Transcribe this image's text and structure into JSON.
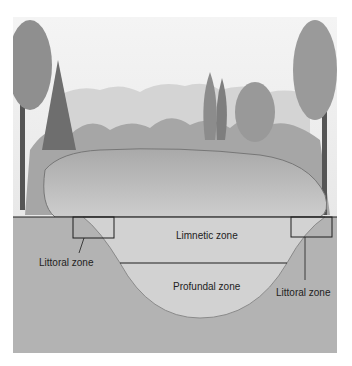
{
  "diagram": {
    "type": "lake cross-section",
    "labels": {
      "limnetic": "Limnetic zone",
      "profundal": "Profundal zone",
      "littoral_left": "Littoral zone",
      "littoral_right": "Littoral zone"
    }
  },
  "colors": {
    "background": "#ffffff",
    "sky": "#f2f2f2",
    "hills": "#cfcfcf",
    "trees": "#8a8a8a",
    "lake_surface": "#bdbdbd",
    "water_section": "#d0d0d0",
    "sediment": "#b3b3b3",
    "lines": "#1e1e1e"
  }
}
